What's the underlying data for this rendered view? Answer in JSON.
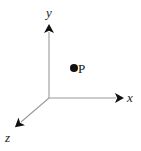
{
  "figure": {
    "kind": "3d-coordinate-axes-diagram",
    "background_color": "#ffffff",
    "axis_line_color": "#999999",
    "arrowhead_color": "#111111",
    "label_color": "#1a1a1a",
    "point_color": "#111111"
  },
  "axes": {
    "origin": {
      "x": 49,
      "y": 98
    },
    "y_axis": {
      "label": "y",
      "from": {
        "x": 49,
        "y": 98
      },
      "to": {
        "x": 49,
        "y": 27
      },
      "direction": "up"
    },
    "x_axis": {
      "label": "x",
      "from": {
        "x": 49,
        "y": 98
      },
      "to": {
        "x": 122,
        "y": 98
      },
      "direction": "right"
    },
    "z_axis": {
      "label": "z",
      "from": {
        "x": 49,
        "y": 98
      },
      "to": {
        "x": 16,
        "y": 126
      },
      "direction": "down-left"
    }
  },
  "point": {
    "label": "P",
    "marker": "filled-dot",
    "x": 75,
    "y": 68
  }
}
